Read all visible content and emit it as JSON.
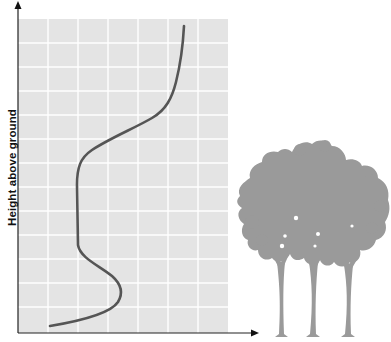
{
  "diagram": {
    "y_axis_label": "Height above ground",
    "x_axis_label": "",
    "colors": {
      "plot_background": "#e4e4e4",
      "grid_lines": "#ffffff",
      "curve": "#555555",
      "axis": "#222222",
      "tree": "#9a9a9a"
    },
    "grid": {
      "columns": 7,
      "rows": 13
    },
    "curve_description": "Vertical profile curve: low near ground, bulge just above ground, minimum through trunk/crown zone, increasing sharply above the canopy",
    "illustration": "three-tree-silhouette"
  }
}
